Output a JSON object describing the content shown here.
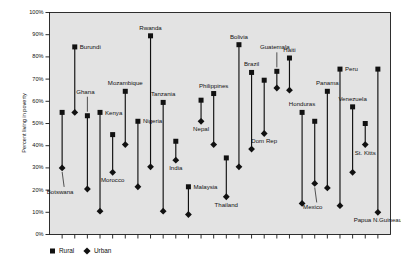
{
  "chart_data": {
    "type": "scatter",
    "title": "",
    "xlabel": "",
    "ylabel": "Percent living in poverty",
    "ylim": [
      0,
      100
    ],
    "ytick_labels": [
      "0%",
      "10%",
      "20%",
      "30%",
      "40%",
      "50%",
      "60%",
      "70%",
      "80%",
      "90%",
      "100%"
    ],
    "ytick_values": [
      0,
      10,
      20,
      30,
      40,
      50,
      60,
      70,
      80,
      90,
      100
    ],
    "grid": false,
    "legend_position": "below-left",
    "series": [
      {
        "name": "Rural",
        "marker": "square"
      },
      {
        "name": "Urban",
        "marker": "diamond"
      }
    ],
    "categories": [
      "Botswana",
      "Burundi",
      "Ghana",
      "Kenya",
      "Morocco",
      "Mozambique",
      "Nigeria",
      "Rwanda",
      "Tanzania",
      "India",
      "Malaysia",
      "Nepal",
      "Philippines",
      "Thailand",
      "Bolivia",
      "Brazil",
      "Dom Rep",
      "Guatemala",
      "Haiti",
      "Honduras",
      "Mexico",
      "Panama",
      "Peru",
      "Venezuela",
      "St. Kitts",
      "Papua N.Guineau"
    ],
    "points": [
      {
        "country": "Botswana",
        "rural": 55,
        "urban": 30,
        "label_pos": "leader-down",
        "label": "Botswana"
      },
      {
        "country": "Burundi",
        "rural": 84.5,
        "urban": 55,
        "label_pos": "right-of-rural",
        "label": "Burundi"
      },
      {
        "country": "Ghana",
        "rural": 53.5,
        "urban": 20.5,
        "label_pos": "leader-up",
        "label": "Ghana"
      },
      {
        "country": "Kenya",
        "rural": 55,
        "urban": 10.5,
        "label_pos": "right-of-rural",
        "label": "Kenya"
      },
      {
        "country": "Morocco",
        "rural": 45,
        "urban": 28,
        "label_pos": "below-urban",
        "label": "Morocco"
      },
      {
        "country": "Mozambique",
        "rural": 64.5,
        "urban": 40.5,
        "label_pos": "above-rural",
        "label": "Mozambique"
      },
      {
        "country": "Nigeria",
        "rural": 51,
        "urban": 21.5,
        "label_pos": "right-of-rural",
        "label": "Nigeria"
      },
      {
        "country": "Rwanda",
        "rural": 89.5,
        "urban": 30.5,
        "label_pos": "above-rural",
        "label": "Rwanda"
      },
      {
        "country": "Tanzania",
        "rural": 59.5,
        "urban": 10.5,
        "label_pos": "above-rural",
        "label": "Tanzania"
      },
      {
        "country": "India",
        "rural": 42,
        "urban": 33.5,
        "label_pos": "below-urban",
        "label": "India"
      },
      {
        "country": "Malaysia",
        "rural": 21.5,
        "urban": 9,
        "label_pos": "right-of-rural",
        "label": "Malaysia"
      },
      {
        "country": "Nepal",
        "rural": 60.5,
        "urban": 51,
        "label_pos": "below-urban",
        "label": "Nepal"
      },
      {
        "country": "Philippines",
        "rural": 63.5,
        "urban": 40.5,
        "label_pos": "above-rural",
        "label": "Philippines"
      },
      {
        "country": "Thailand",
        "rural": 34.5,
        "urban": 17,
        "label_pos": "below-urban",
        "label": "Thailand"
      },
      {
        "country": "Bolivia",
        "rural": 85.5,
        "urban": 30.5,
        "label_pos": "above-rural",
        "label": "Bolivia"
      },
      {
        "country": "Brazil",
        "rural": 73,
        "urban": 38.5,
        "label_pos": "above-rural",
        "label": "Brazil"
      },
      {
        "country": "Dom Rep",
        "rural": 69.5,
        "urban": 45.5,
        "label_pos": "below-urban",
        "label": "Dom Rep"
      },
      {
        "country": "Guatemala",
        "rural": 73.5,
        "urban": 66,
        "label_pos": "leader-up",
        "label": "Guatemala"
      },
      {
        "country": "Haiti",
        "rural": 79.5,
        "urban": 65,
        "label_pos": "above-rural",
        "label": "Haiti"
      },
      {
        "country": "Honduras",
        "rural": 55,
        "urban": 14,
        "label_pos": "above-rural",
        "label": "Honduras"
      },
      {
        "country": "Mexico",
        "rural": 51,
        "urban": 23,
        "label_pos": "leader-down",
        "label": "Mexico"
      },
      {
        "country": "Panama",
        "rural": 64.5,
        "urban": 21,
        "label_pos": "above-rural",
        "label": "Panama"
      },
      {
        "country": "Peru",
        "rural": 74.5,
        "urban": 13,
        "label_pos": "right-of-rural",
        "label": "Peru"
      },
      {
        "country": "Venezuela",
        "rural": 57.5,
        "urban": 28,
        "label_pos": "above-rural",
        "label": "Venezuela"
      },
      {
        "country": "St. Kitts",
        "rural": 50,
        "urban": 40.5,
        "label_pos": "below-urban",
        "label": "St. Kitts"
      },
      {
        "country": "Papua N.Guineau",
        "rural": 74.5,
        "urban": 10,
        "label_pos": "below-urban",
        "label": "Papua N.Guineau"
      }
    ]
  },
  "legend": {
    "rural_label": "Rural",
    "urban_label": "Urban"
  },
  "axis": {
    "y_title": "Percent living in poverty"
  }
}
